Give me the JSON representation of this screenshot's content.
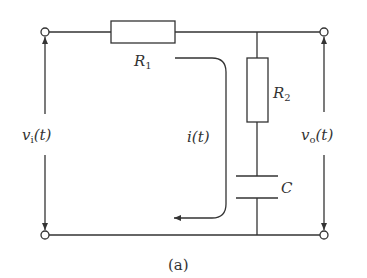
{
  "figure": {
    "caption": "(a)",
    "components": {
      "r1": {
        "name": "R",
        "sub": "1"
      },
      "r2": {
        "name": "R",
        "sub": "2"
      },
      "c": {
        "name": "C"
      }
    },
    "signals": {
      "vi": {
        "var": "v",
        "sub": "i",
        "arg": "(t)"
      },
      "vo": {
        "var": "v",
        "sub": "o",
        "arg": "(t)"
      },
      "i": {
        "var": "i",
        "arg": "(t)"
      }
    },
    "colors": {
      "line": "#333333",
      "background": "#ffffff"
    }
  }
}
